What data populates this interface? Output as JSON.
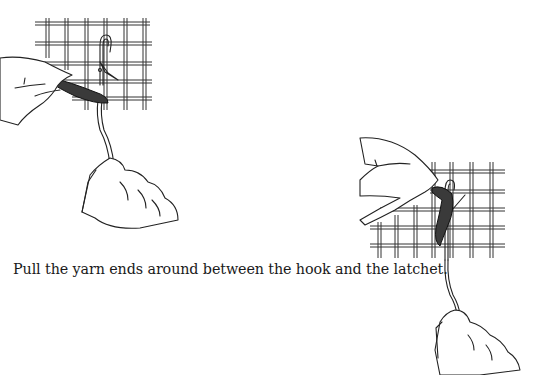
{
  "document": {
    "caption": "Pull the yarn ends around between the hook and the latchet.",
    "illustrations": [
      {
        "id": "left",
        "depiction": "hand holding yarn ends over latch hook inserted in rug canvas grid, latchet open"
      },
      {
        "id": "right",
        "depiction": "hand pulling yarn ends around between hook and latchet on rug canvas grid"
      }
    ]
  }
}
